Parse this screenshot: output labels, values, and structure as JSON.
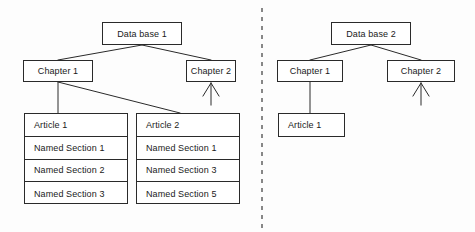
{
  "figure": {
    "type": "diagram",
    "subtype": "hierarchical-tree-comparison",
    "background_color": "#fdfdfd",
    "line_color": "#2a2a2a",
    "text_color": "#1a1a1a",
    "divider": {
      "name": "panel-divider",
      "style": "dashed-vertical",
      "x": 262,
      "y_start": 8,
      "y_end": 228
    }
  },
  "left_panel": {
    "name": "left-diagram-panel",
    "root": {
      "label": "Data base 1",
      "x": 102,
      "y": 22,
      "w": 80,
      "h": 23
    },
    "chapters": [
      {
        "label": "Chapter 1",
        "x": 23,
        "y": 60,
        "w": 70,
        "h": 22
      },
      {
        "label": "Chapter 2",
        "x": 186,
        "y": 60,
        "w": 50,
        "h": 22
      }
    ],
    "articles": [
      {
        "name": "article-stack-1",
        "x": 24,
        "y": 113,
        "w": 104,
        "h": 91,
        "cells": [
          "Article 1",
          "Named Section 1",
          "Named Section 2",
          "Named Section 3"
        ]
      },
      {
        "name": "article-stack-2",
        "x": 136,
        "y": 113,
        "w": 104,
        "h": 91,
        "cells": [
          "Article 2",
          "Named Section 1",
          "Named Section 3",
          "Named Section 5"
        ]
      }
    ],
    "incoming_arrow": {
      "target": "Chapter 2",
      "direction": "up",
      "tip_x": 211,
      "tip_y": 83
    }
  },
  "right_panel": {
    "name": "right-diagram-panel",
    "root": {
      "label": "Data base 2",
      "x": 331,
      "y": 22,
      "w": 80,
      "h": 23
    },
    "chapters": [
      {
        "label": "Chapter 1",
        "x": 277,
        "y": 60,
        "w": 66,
        "h": 22
      },
      {
        "label": "Chapter 2",
        "x": 387,
        "y": 60,
        "w": 68,
        "h": 22
      }
    ],
    "articles": [
      {
        "name": "article-box-right",
        "label": "Article 1",
        "x": 278,
        "y": 113,
        "w": 67,
        "h": 24
      }
    ],
    "incoming_arrow": {
      "target": "Chapter 2",
      "direction": "up",
      "tip_x": 421,
      "tip_y": 83
    }
  }
}
